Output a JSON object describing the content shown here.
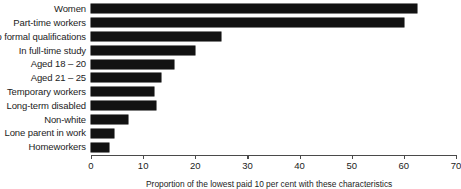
{
  "chart_data": {
    "type": "bar",
    "orientation": "horizontal",
    "title": "",
    "xlabel": "Proportion of the lowest paid 10 per cent with these characteristics",
    "ylabel": "",
    "xlim": [
      0,
      70
    ],
    "xticks": [
      0,
      10,
      20,
      30,
      40,
      50,
      60,
      70
    ],
    "grid": false,
    "legend": null,
    "bar_color": "#121212",
    "axis_color": "#4a4a4a",
    "categories": [
      "Women",
      "Part-time workers",
      "No formal qualifications",
      "In full-time study",
      "Aged 18 – 20",
      "Aged 21 – 25",
      "Temporary workers",
      "Long-term disabled",
      "Non-white",
      "Lone parent in work",
      "Homeworkers"
    ],
    "values": [
      62.5,
      60,
      25,
      20,
      16,
      13.5,
      12,
      12.5,
      7,
      4.5,
      3.5
    ]
  }
}
